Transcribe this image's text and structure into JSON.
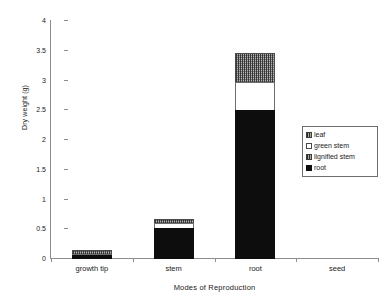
{
  "chart_data": {
    "type": "bar",
    "stacked": true,
    "title": "",
    "xlabel": "Modes of Reproduction",
    "ylabel": "Dry weight (g)",
    "categories": [
      "growth tip",
      "stem",
      "root",
      "seed"
    ],
    "ylim": [
      0,
      4
    ],
    "yticks": [
      0,
      0.5,
      1,
      1.5,
      2,
      2.5,
      3,
      3.5,
      4
    ],
    "ytick_labels": [
      "0",
      "0.5",
      "1",
      "1.5",
      "2",
      "2.5",
      "3",
      "3.5",
      "4"
    ],
    "grid": false,
    "legend_position": "right",
    "series": [
      {
        "name": "root",
        "values": [
          0.06,
          0.52,
          2.5,
          0
        ]
      },
      {
        "name": "green stem",
        "values": [
          0.04,
          0.1,
          0.5,
          0
        ]
      },
      {
        "name": "lignified stem",
        "values": [
          0.09,
          0.08,
          0.5,
          0
        ]
      },
      {
        "name": "leaf",
        "values": [
          0,
          0,
          0,
          0
        ]
      }
    ],
    "totals": [
      0.19,
      0.7,
      3.5,
      0
    ]
  },
  "legend": {
    "items": [
      {
        "label": "leaf",
        "swatch": "leaf"
      },
      {
        "label": "green stem",
        "swatch": "green-stem"
      },
      {
        "label": "lignified stem",
        "swatch": "lignified-stem"
      },
      {
        "label": "root",
        "swatch": "root"
      }
    ]
  },
  "axes": {
    "y_title": "Dry weight (g)",
    "x_title": "Modes of Reproduction"
  }
}
